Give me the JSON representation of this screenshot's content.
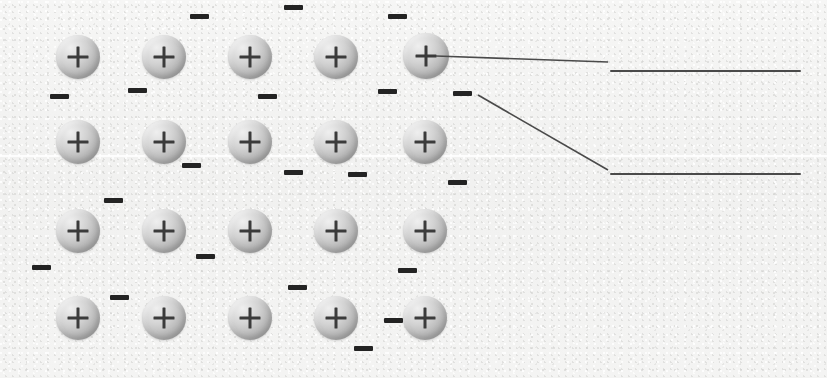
{
  "diagram": {
    "background_color": "#f3f3f2",
    "ion_symbol": "+",
    "electron_symbol": "-",
    "ion_label": "positive metal ion",
    "electron_label": "delocalised electron",
    "ion_color": "#bdbdbd",
    "electron_color": "#232323",
    "line_color": "#4a4a4a",
    "grid": {
      "rows": 4,
      "columns": 5,
      "total_ions": 20
    },
    "ions": [
      {
        "row": 1,
        "col": 1,
        "x": 56,
        "y": 35,
        "size": 44
      },
      {
        "row": 1,
        "col": 2,
        "x": 142,
        "y": 35,
        "size": 44
      },
      {
        "row": 1,
        "col": 3,
        "x": 228,
        "y": 35,
        "size": 44
      },
      {
        "row": 1,
        "col": 4,
        "x": 314,
        "y": 35,
        "size": 44
      },
      {
        "row": 1,
        "col": 5,
        "x": 403,
        "y": 33,
        "size": 46
      },
      {
        "row": 2,
        "col": 1,
        "x": 56,
        "y": 120,
        "size": 44
      },
      {
        "row": 2,
        "col": 2,
        "x": 142,
        "y": 120,
        "size": 44
      },
      {
        "row": 2,
        "col": 3,
        "x": 228,
        "y": 120,
        "size": 44
      },
      {
        "row": 2,
        "col": 4,
        "x": 314,
        "y": 120,
        "size": 44
      },
      {
        "row": 2,
        "col": 5,
        "x": 403,
        "y": 120,
        "size": 44
      },
      {
        "row": 3,
        "col": 1,
        "x": 56,
        "y": 209,
        "size": 44
      },
      {
        "row": 3,
        "col": 2,
        "x": 142,
        "y": 209,
        "size": 44
      },
      {
        "row": 3,
        "col": 3,
        "x": 228,
        "y": 209,
        "size": 44
      },
      {
        "row": 3,
        "col": 4,
        "x": 314,
        "y": 209,
        "size": 44
      },
      {
        "row": 3,
        "col": 5,
        "x": 403,
        "y": 209,
        "size": 44
      },
      {
        "row": 4,
        "col": 1,
        "x": 56,
        "y": 296,
        "size": 44
      },
      {
        "row": 4,
        "col": 2,
        "x": 142,
        "y": 296,
        "size": 44
      },
      {
        "row": 4,
        "col": 3,
        "x": 228,
        "y": 296,
        "size": 44
      },
      {
        "row": 4,
        "col": 4,
        "x": 314,
        "y": 296,
        "size": 44
      },
      {
        "row": 4,
        "col": 5,
        "x": 403,
        "y": 296,
        "size": 44
      }
    ],
    "electrons": [
      {
        "x": 190,
        "y": 14,
        "w": 19,
        "h": 5
      },
      {
        "x": 284,
        "y": 5,
        "w": 19,
        "h": 5
      },
      {
        "x": 388,
        "y": 14,
        "w": 19,
        "h": 5
      },
      {
        "x": 50,
        "y": 94,
        "w": 19,
        "h": 5
      },
      {
        "x": 128,
        "y": 88,
        "w": 19,
        "h": 5
      },
      {
        "x": 258,
        "y": 94,
        "w": 19,
        "h": 5
      },
      {
        "x": 378,
        "y": 89,
        "w": 19,
        "h": 5
      },
      {
        "x": 453,
        "y": 91,
        "w": 19,
        "h": 5
      },
      {
        "x": 182,
        "y": 163,
        "w": 19,
        "h": 5
      },
      {
        "x": 284,
        "y": 170,
        "w": 19,
        "h": 5
      },
      {
        "x": 348,
        "y": 172,
        "w": 19,
        "h": 5
      },
      {
        "x": 448,
        "y": 180,
        "w": 19,
        "h": 5
      },
      {
        "x": 104,
        "y": 198,
        "w": 19,
        "h": 5
      },
      {
        "x": 32,
        "y": 265,
        "w": 19,
        "h": 5
      },
      {
        "x": 196,
        "y": 254,
        "w": 19,
        "h": 5
      },
      {
        "x": 398,
        "y": 268,
        "w": 19,
        "h": 5
      },
      {
        "x": 110,
        "y": 295,
        "w": 19,
        "h": 5
      },
      {
        "x": 288,
        "y": 285,
        "w": 19,
        "h": 5
      },
      {
        "x": 384,
        "y": 318,
        "w": 19,
        "h": 5
      },
      {
        "x": 354,
        "y": 346,
        "w": 19,
        "h": 5
      }
    ],
    "callouts": [
      {
        "name": "callout-ion",
        "from_x": 436,
        "from_y": 56,
        "to_x": 608,
        "to_y": 62,
        "rule_x": 610,
        "rule_y": 70,
        "rule_width": 191,
        "answer": ""
      },
      {
        "name": "callout-electron",
        "from_x": 478,
        "from_y": 95,
        "to_x": 608,
        "to_y": 170,
        "rule_x": 610,
        "rule_y": 173,
        "rule_width": 191,
        "answer": ""
      }
    ],
    "scan_band_y": 155
  }
}
